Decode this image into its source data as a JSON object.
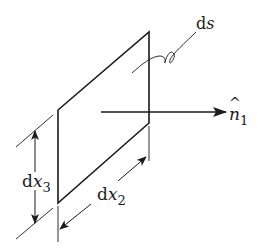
{
  "diagram": {
    "colors": {
      "stroke": "#1a1a1a",
      "background": "#ffffff"
    },
    "labels": {
      "ds": {
        "d": "d",
        "var": "s"
      },
      "normal": {
        "hat": "^",
        "var": "n",
        "sub": "1"
      },
      "dx3": {
        "d": "d",
        "var": "x",
        "sub": "3"
      },
      "dx2": {
        "d": "d",
        "var": "x",
        "sub": "2"
      }
    },
    "elements": [
      {
        "id": "surface-element",
        "type": "parallelogram",
        "label": "ds"
      },
      {
        "id": "normal-vector",
        "type": "arrow",
        "label": "n̂1"
      },
      {
        "id": "dimension-dx3",
        "type": "dimension",
        "label": "dx3"
      },
      {
        "id": "dimension-dx2",
        "type": "dimension",
        "label": "dx2"
      }
    ]
  }
}
